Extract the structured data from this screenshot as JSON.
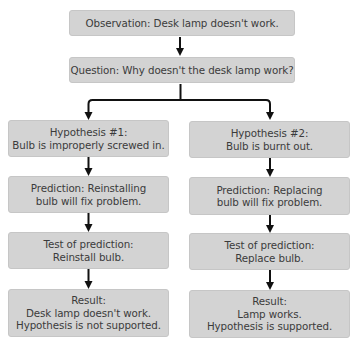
{
  "diagram": {
    "observation": {
      "lines": [
        "Observation: Desk lamp doesn't work."
      ]
    },
    "question": {
      "lines": [
        "Question: Why doesn't the desk lamp work?"
      ]
    },
    "branches": [
      {
        "hypothesis": {
          "lines": [
            "Hypothesis #1:",
            "Bulb is improperly screwed in."
          ]
        },
        "prediction": {
          "lines": [
            "Prediction: Reinstalling",
            "bulb will fix problem."
          ]
        },
        "test": {
          "lines": [
            "Test of prediction:",
            "Reinstall bulb."
          ]
        },
        "result": {
          "lines": [
            "Result:",
            "Desk lamp doesn't work.",
            "Hypothesis is not supported."
          ]
        }
      },
      {
        "hypothesis": {
          "lines": [
            "Hypothesis #2:",
            "Bulb is burnt out."
          ]
        },
        "prediction": {
          "lines": [
            "Prediction: Replacing",
            "bulb will fix problem."
          ]
        },
        "test": {
          "lines": [
            "Test of prediction:",
            "Replace bulb."
          ]
        },
        "result": {
          "lines": [
            "Result:",
            "Lamp works.",
            "Hypothesis is supported."
          ]
        }
      }
    ],
    "colors": {
      "box_fill": "#d3d3d3",
      "box_border": "#c6c6c6",
      "text": "#3b3b3b",
      "arrow": "#111111",
      "background": "#ffffff"
    }
  }
}
